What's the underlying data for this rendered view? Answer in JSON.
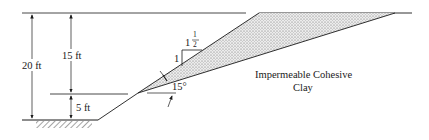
{
  "diagram": {
    "dimensions": {
      "total_height": "20 ft",
      "upper_height": "15 ft",
      "lower_height": "5 ft"
    },
    "slope_ratio": {
      "vertical": "1",
      "horizontal_whole": "1",
      "horizontal_num": "1",
      "horizontal_den": "2"
    },
    "angle_label": "15°",
    "material_label_line1": "Impermeable Cohesive",
    "material_label_line2": "Clay",
    "colors": {
      "line": "#1a1a1a",
      "fill": "#d9d9d9",
      "background": "#ffffff"
    }
  }
}
